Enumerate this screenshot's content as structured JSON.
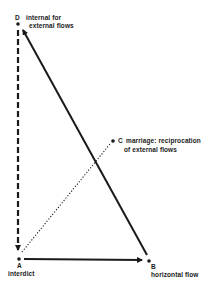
{
  "diagram": {
    "nodes": {
      "D": {
        "letter": "D",
        "line1": "internal for",
        "line2": "external flows"
      },
      "C": {
        "letter": "C",
        "line1": "marriage: reciprocation",
        "line2": "of external flows"
      },
      "A": {
        "letter": "A",
        "label": "interdict"
      },
      "B": {
        "letter": "B",
        "label": "horizontal flow"
      }
    },
    "edges": [
      {
        "from": "D",
        "to": "A",
        "style": "dashed-arrow"
      },
      {
        "from": "A",
        "to": "B",
        "style": "solid-arrow"
      },
      {
        "from": "B",
        "to": "D",
        "style": "solid-arrow"
      },
      {
        "from": "A",
        "to": "C",
        "style": "dotted"
      }
    ],
    "colors": {
      "ink": "#1a1a1a",
      "background": "#ffffff"
    }
  }
}
